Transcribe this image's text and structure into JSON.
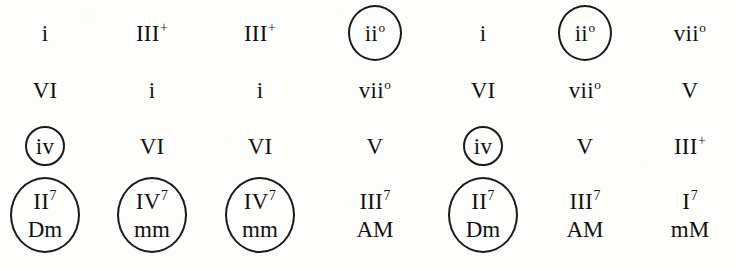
{
  "figure": {
    "rows": 4,
    "columns": 7,
    "ink_color": "#111111",
    "paper_color": "#fdfdfb",
    "circle_color": "#1a1a1a"
  },
  "grid": [
    {
      "row": 1,
      "cells": [
        {
          "numeral": "i",
          "mod": "",
          "quality": "",
          "circled": false,
          "circle": "none"
        },
        {
          "numeral": "III",
          "mod": "+",
          "quality": "",
          "circled": false,
          "circle": "none"
        },
        {
          "numeral": "III",
          "mod": "+",
          "quality": "",
          "circled": false,
          "circle": "none"
        },
        {
          "numeral": "ii",
          "mod": "o",
          "quality": "",
          "circled": true,
          "circle": "medium"
        },
        {
          "numeral": "i",
          "mod": "",
          "quality": "",
          "circled": false,
          "circle": "none"
        },
        {
          "numeral": "ii",
          "mod": "o",
          "quality": "",
          "circled": true,
          "circle": "medium"
        },
        {
          "numeral": "vii",
          "mod": "o",
          "quality": "",
          "circled": false,
          "circle": "none"
        }
      ]
    },
    {
      "row": 2,
      "cells": [
        {
          "numeral": "VI",
          "mod": "",
          "quality": "",
          "circled": false,
          "circle": "none"
        },
        {
          "numeral": "i",
          "mod": "",
          "quality": "",
          "circled": false,
          "circle": "none"
        },
        {
          "numeral": "i",
          "mod": "",
          "quality": "",
          "circled": false,
          "circle": "none"
        },
        {
          "numeral": "vii",
          "mod": "o",
          "quality": "",
          "circled": false,
          "circle": "none"
        },
        {
          "numeral": "VI",
          "mod": "",
          "quality": "",
          "circled": false,
          "circle": "none"
        },
        {
          "numeral": "vii",
          "mod": "o",
          "quality": "",
          "circled": false,
          "circle": "none"
        },
        {
          "numeral": "V",
          "mod": "",
          "quality": "",
          "circled": false,
          "circle": "none"
        }
      ]
    },
    {
      "row": 3,
      "cells": [
        {
          "numeral": "iv",
          "mod": "",
          "quality": "",
          "circled": true,
          "circle": "small"
        },
        {
          "numeral": "VI",
          "mod": "",
          "quality": "",
          "circled": false,
          "circle": "none"
        },
        {
          "numeral": "VI",
          "mod": "",
          "quality": "",
          "circled": false,
          "circle": "none"
        },
        {
          "numeral": "V",
          "mod": "",
          "quality": "",
          "circled": false,
          "circle": "none"
        },
        {
          "numeral": "iv",
          "mod": "",
          "quality": "",
          "circled": true,
          "circle": "small"
        },
        {
          "numeral": "V",
          "mod": "",
          "quality": "",
          "circled": false,
          "circle": "none"
        },
        {
          "numeral": "III",
          "mod": "+",
          "quality": "",
          "circled": false,
          "circle": "none"
        }
      ]
    },
    {
      "row": 4,
      "cells": [
        {
          "numeral": "II",
          "mod": "7",
          "quality": "Dm",
          "circled": true,
          "circle": "large"
        },
        {
          "numeral": "IV",
          "mod": "7",
          "quality": "mm",
          "circled": true,
          "circle": "large"
        },
        {
          "numeral": "IV",
          "mod": "7",
          "quality": "mm",
          "circled": true,
          "circle": "large"
        },
        {
          "numeral": "III",
          "mod": "7",
          "quality": "AM",
          "circled": false,
          "circle": "none"
        },
        {
          "numeral": "II",
          "mod": "7",
          "quality": "Dm",
          "circled": true,
          "circle": "large"
        },
        {
          "numeral": "III",
          "mod": "7",
          "quality": "AM",
          "circled": false,
          "circle": "none"
        },
        {
          "numeral": "I",
          "mod": "7",
          "quality": "mM",
          "circled": false,
          "circle": "none"
        }
      ]
    }
  ],
  "layout": {
    "column_centers_px": [
      45,
      152,
      260,
      375,
      483,
      585,
      690
    ],
    "row_centers_px": [
      33,
      90,
      146,
      215
    ]
  }
}
